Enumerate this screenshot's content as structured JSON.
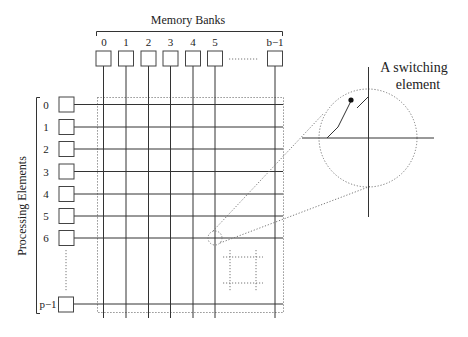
{
  "diagram": {
    "memory_banks": {
      "title": "Memory Banks",
      "labels": [
        "0",
        "1",
        "2",
        "3",
        "4",
        "5",
        "b−1"
      ],
      "ellipsis": "………"
    },
    "processing_elements": {
      "title": "Processing Elements",
      "labels": [
        "0",
        "1",
        "2",
        "3",
        "4",
        "5",
        "6",
        "p−1"
      ]
    },
    "callout": {
      "line1": "A switching",
      "line2": "element"
    },
    "colors": {
      "line": "#333333",
      "dotted": "#777777",
      "background": "#ffffff"
    }
  }
}
